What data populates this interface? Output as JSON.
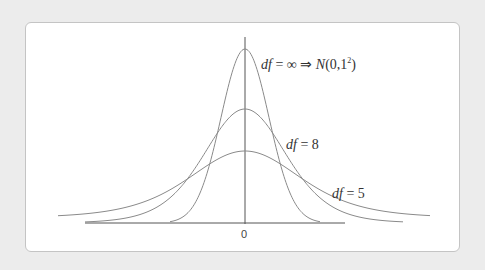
{
  "chart_data": {
    "type": "line",
    "title": "",
    "xlabel": "",
    "ylabel": "",
    "x_ticks": [
      "0"
    ],
    "series": [
      {
        "name": "df = ∞ ⇒ N(0,1²)",
        "peak_y": 0.399,
        "description": "standard normal density"
      },
      {
        "name": "df = 8",
        "peak_y": 0.22,
        "description": "t-distribution, 8 degrees of freedom (drawn flattened)"
      },
      {
        "name": "df = 5",
        "peak_y": 0.14,
        "description": "t-distribution, 5 degrees of freedom (drawn flattened)"
      }
    ],
    "annotations": [
      "df = ∞ ⇒ N(0,1²)",
      "df = 8",
      "df = 5"
    ],
    "grid": false,
    "legend": "inline labels"
  },
  "labels": {
    "normal_df": "df",
    "normal_rest": " = ∞  ⇒ ",
    "normal_N": "N",
    "normal_params": "(0,1",
    "normal_sup": "2",
    "normal_close": ")",
    "df8_df": "df",
    "df8_rest": " = 8",
    "df5_df": "df",
    "df5_rest": " = 5",
    "zero": "0"
  },
  "colors": {
    "background": "#ececec",
    "card": "#ffffff",
    "curve": "#8a8a8a",
    "axis": "#444444"
  }
}
